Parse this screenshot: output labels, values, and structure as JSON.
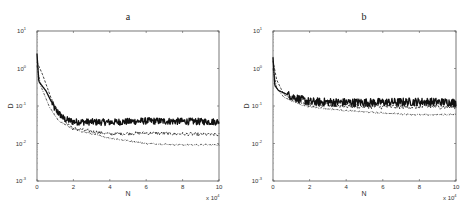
{
  "chart_data": [
    {
      "type": "line",
      "panel": "a",
      "title": "a",
      "xlabel": "N",
      "ylabel": "D",
      "x_multiplier": "x 10^4",
      "xlim": [
        0,
        10
      ],
      "ylim": [
        0.001,
        10
      ],
      "yscale": "log",
      "xticks": [
        "0",
        "2",
        "4",
        "6",
        "8",
        "10"
      ],
      "yticks": [
        {
          "base": "10",
          "exp": "1"
        },
        {
          "base": "10",
          "exp": "0"
        },
        {
          "base": "10",
          "exp": "-1"
        },
        {
          "base": "10",
          "exp": "-2"
        },
        {
          "base": "10",
          "exp": "-3"
        }
      ],
      "grid": false,
      "legend": "none",
      "series": [
        {
          "name": "solid",
          "style": "solid",
          "x": [
            0,
            0.1,
            0.5,
            1.0,
            1.5,
            2,
            4,
            6,
            8,
            10
          ],
          "y": [
            2.5,
            0.45,
            0.25,
            0.08,
            0.045,
            0.038,
            0.037,
            0.04,
            0.039,
            0.038
          ],
          "noise": 0.09,
          "width": 1.3
        },
        {
          "name": "dashed",
          "style": "dashed",
          "x": [
            0,
            0.3,
            0.8,
            1.5,
            2,
            4,
            6,
            8,
            10
          ],
          "y": [
            1.5,
            0.7,
            0.15,
            0.04,
            0.025,
            0.018,
            0.019,
            0.018,
            0.017
          ],
          "noise": 0.045,
          "width": 0.8
        },
        {
          "name": "dash-dot",
          "style": "dashdot",
          "x": [
            0,
            0.2,
            0.7,
            1.2,
            2,
            3,
            4,
            6,
            8,
            10
          ],
          "y": [
            1.2,
            0.35,
            0.09,
            0.04,
            0.024,
            0.018,
            0.014,
            0.01,
            0.0092,
            0.0092
          ],
          "noise": 0.02,
          "width": 0.7
        }
      ]
    },
    {
      "type": "line",
      "panel": "b",
      "title": "b",
      "xlabel": "N",
      "ylabel": "D",
      "x_multiplier": "x 10^4",
      "xlim": [
        0,
        10
      ],
      "ylim": [
        0.001,
        10
      ],
      "yscale": "log",
      "xticks": [
        "0",
        "2",
        "4",
        "6",
        "8",
        "10"
      ],
      "yticks": [
        {
          "base": "10",
          "exp": "1"
        },
        {
          "base": "10",
          "exp": "0"
        },
        {
          "base": "10",
          "exp": "-1"
        },
        {
          "base": "10",
          "exp": "-2"
        },
        {
          "base": "10",
          "exp": "-3"
        }
      ],
      "grid": false,
      "legend": "none",
      "series": [
        {
          "name": "solid",
          "style": "solid",
          "x": [
            0,
            0.1,
            0.3,
            0.8,
            1.5,
            2,
            4,
            6,
            8,
            10
          ],
          "y": [
            2.0,
            0.35,
            0.26,
            0.2,
            0.15,
            0.13,
            0.125,
            0.125,
            0.13,
            0.125
          ],
          "noise": 0.11,
          "width": 1.3
        },
        {
          "name": "dashed",
          "style": "dashed",
          "x": [
            0,
            0.2,
            0.6,
            1.5,
            2,
            4,
            6,
            8,
            10
          ],
          "y": [
            1.6,
            0.5,
            0.2,
            0.13,
            0.11,
            0.1,
            0.095,
            0.095,
            0.095
          ],
          "noise": 0.06,
          "width": 0.8
        },
        {
          "name": "dash-dot",
          "style": "dashdot",
          "x": [
            0,
            0.2,
            0.6,
            1.5,
            2,
            4,
            6,
            8,
            10
          ],
          "y": [
            1.0,
            0.3,
            0.17,
            0.11,
            0.095,
            0.075,
            0.065,
            0.058,
            0.06
          ],
          "noise": 0.02,
          "width": 0.7
        }
      ]
    }
  ],
  "panels": [
    {
      "title": "a",
      "xlabel": "N",
      "ylabel": "D",
      "multiplier_base": "x 10",
      "multiplier_exp": "4"
    },
    {
      "title": "b",
      "xlabel": "N",
      "ylabel": "D",
      "multiplier_base": "x 10",
      "multiplier_exp": "4"
    }
  ],
  "colors": {
    "axis": "#555555",
    "line": "#111111",
    "text": "#333333"
  }
}
